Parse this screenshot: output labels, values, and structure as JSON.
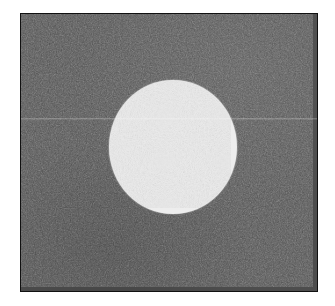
{
  "figure": {
    "kind": "grayscale-noisy-phantom-image",
    "title": "",
    "caption": "",
    "canvas_width": 335,
    "canvas_height": 306,
    "page_background_color": "#ffffff"
  },
  "frame": {
    "name": "image-frame",
    "border_color": "#111111",
    "border_width_px": 1.5,
    "left": 20,
    "top": 13,
    "width": 298,
    "height": 279
  },
  "background_field": {
    "label": "noisy dark background",
    "mean_gray_hex": "#4d4d4d",
    "mean_gray_value": 77,
    "noise_type": "gaussian-speckle",
    "noise_strength": "moderate"
  },
  "disk": {
    "label": "bright circular disk",
    "shape": "circle",
    "center_x": 172,
    "center_y": 146,
    "radius_x": 64,
    "radius_y": 67,
    "mean_gray_hex": "#ededed",
    "mean_gray_value": 237,
    "noise_type": "gaussian-speckle",
    "noise_strength": "low",
    "edge": "soft"
  },
  "artifacts": {
    "scanline": {
      "label": "faint horizontal scanline",
      "y": 117,
      "thickness_px": 1,
      "brightness": "slightly lighter than surround"
    }
  },
  "chart_data": {
    "type": "heatmap",
    "title": "",
    "xlabel": "",
    "ylabel": "",
    "regions": [
      {
        "name": "background",
        "value": 77,
        "fraction_of_area": 0.84
      },
      {
        "name": "disk",
        "value": 237,
        "fraction_of_area": 0.16
      }
    ],
    "value_range": [
      0,
      255
    ],
    "colormap": "gray",
    "grid": false,
    "legend": "none"
  }
}
